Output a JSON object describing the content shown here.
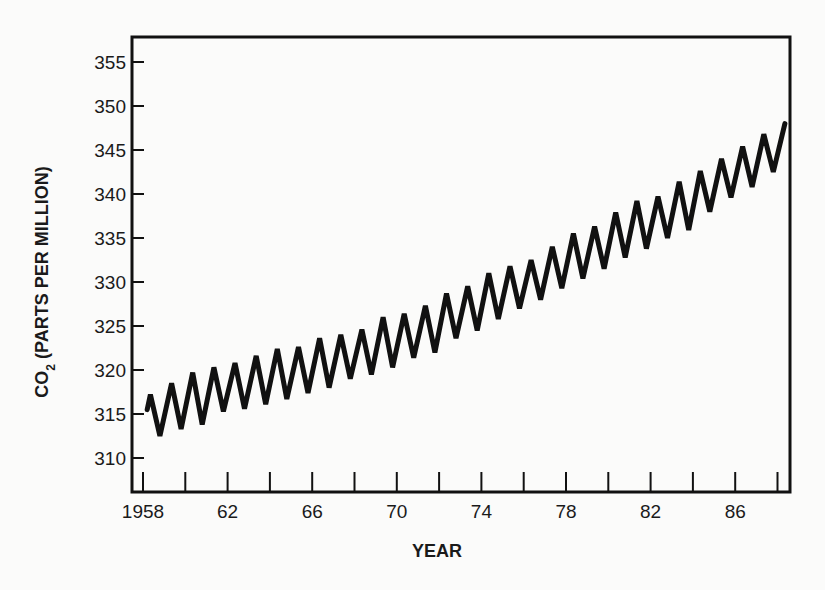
{
  "chart_data": {
    "type": "line",
    "title": "",
    "xlabel": "YEAR",
    "ylabel": "CO2 (PARTS PER MILLION)",
    "ylabel_parts": {
      "pre": "CO",
      "sub": "2",
      "post": " (PARTS PER MILLION)"
    },
    "xlim": [
      1957.5,
      1988.6
    ],
    "ylim": [
      306.9,
      357.9
    ],
    "x_ticks": [
      1958,
      1960,
      1962,
      1964,
      1966,
      1968,
      1970,
      1972,
      1974,
      1976,
      1978,
      1980,
      1982,
      1984,
      1986,
      1988
    ],
    "x_tick_labels": [
      {
        "value": 1958,
        "label": "1958"
      },
      {
        "value": 1962,
        "label": "62"
      },
      {
        "value": 1966,
        "label": "66"
      },
      {
        "value": 1970,
        "label": "70"
      },
      {
        "value": 1974,
        "label": "74"
      },
      {
        "value": 1978,
        "label": "78"
      },
      {
        "value": 1982,
        "label": "82"
      },
      {
        "value": 1986,
        "label": "86"
      }
    ],
    "y_ticks": [
      310,
      315,
      320,
      325,
      330,
      335,
      340,
      345,
      350,
      355
    ],
    "y_tick_labels": [
      "310",
      "315",
      "320",
      "325",
      "330",
      "335",
      "340",
      "345",
      "350",
      "355"
    ],
    "grid": false,
    "legend": null,
    "line_color": "#111111",
    "series": [
      {
        "name": "CO2 concentration (seasonal peaks and troughs)",
        "x": [
          1958.2,
          1958.35,
          1958.8,
          1959.35,
          1959.8,
          1960.35,
          1960.8,
          1961.35,
          1961.8,
          1962.35,
          1962.8,
          1963.35,
          1963.8,
          1964.35,
          1964.8,
          1965.35,
          1965.8,
          1966.35,
          1966.8,
          1967.35,
          1967.8,
          1968.35,
          1968.8,
          1969.35,
          1969.8,
          1970.35,
          1970.8,
          1971.35,
          1971.8,
          1972.35,
          1972.8,
          1973.35,
          1973.8,
          1974.35,
          1974.8,
          1975.35,
          1975.8,
          1976.35,
          1976.8,
          1977.35,
          1977.8,
          1978.35,
          1978.8,
          1979.35,
          1979.8,
          1980.35,
          1980.8,
          1981.35,
          1981.8,
          1982.35,
          1982.8,
          1983.35,
          1983.8,
          1984.35,
          1984.8,
          1985.35,
          1985.8,
          1986.35,
          1986.8,
          1987.35,
          1987.8,
          1988.35
        ],
        "values": [
          315.5,
          317.2,
          312.5,
          318.5,
          313.3,
          319.7,
          313.8,
          320.3,
          315.3,
          320.8,
          315.6,
          321.6,
          316.1,
          322.4,
          316.7,
          322.6,
          317.4,
          323.6,
          318.0,
          324.0,
          319.0,
          324.6,
          319.5,
          326.0,
          320.3,
          326.4,
          321.4,
          327.3,
          322.0,
          328.7,
          323.6,
          329.5,
          324.5,
          331.0,
          325.8,
          331.8,
          327.0,
          332.5,
          328.0,
          334.0,
          329.3,
          335.5,
          330.4,
          336.3,
          331.5,
          337.9,
          332.8,
          339.2,
          333.8,
          339.7,
          335.0,
          341.4,
          335.9,
          342.6,
          338.0,
          344.0,
          339.6,
          345.4,
          340.8,
          346.8,
          342.5,
          348.0
        ]
      }
    ]
  }
}
